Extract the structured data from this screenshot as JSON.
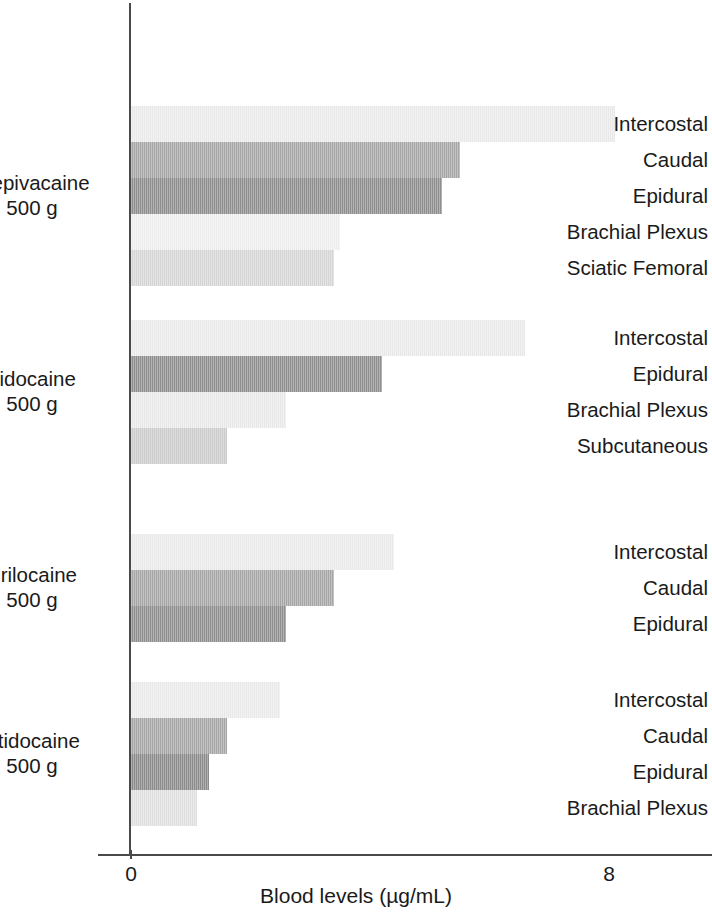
{
  "chart_data": {
    "type": "bar",
    "orientation": "horizontal",
    "title": "",
    "xlabel": "Blood levels (µg/mL)",
    "ylabel": "",
    "xlim": [
      0,
      8.6
    ],
    "xticks": [
      0,
      8
    ],
    "xticklabels": [
      "0",
      "8"
    ],
    "grid": false,
    "legend": "none",
    "groups": [
      {
        "name": "Mepivacaine",
        "dose": "500 g",
        "label": "Mepivacaine\n500 g",
        "bars": [
          {
            "label": "Intercostal",
            "value": 8.1,
            "color": "#ededed"
          },
          {
            "label": "Caudal",
            "value": 5.5,
            "color": "#a9a9a9"
          },
          {
            "label": "Epidural",
            "value": 5.2,
            "color": "#919191"
          },
          {
            "label": "Brachial Plexus",
            "value": 3.5,
            "color": "#f1f1f1"
          },
          {
            "label": "Sciatic Femoral",
            "value": 3.4,
            "color": "#d9d9d9"
          }
        ]
      },
      {
        "name": "Lidocaine",
        "dose": "500 g",
        "label": "Lidocaine\n500 g",
        "bars": [
          {
            "label": "Intercostal",
            "value": 6.6,
            "color": "#ededed"
          },
          {
            "label": "Epidural",
            "value": 4.2,
            "color": "#919191"
          },
          {
            "label": "Brachial Plexus",
            "value": 2.6,
            "color": "#ececec"
          },
          {
            "label": "Subcutaneous",
            "value": 1.6,
            "color": "#cfcfcf"
          }
        ]
      },
      {
        "name": "Prilocaine",
        "dose": "500 g",
        "label": "Prilocaine\n500 g",
        "bars": [
          {
            "label": "Intercostal",
            "value": 4.4,
            "color": "#ededed"
          },
          {
            "label": "Caudal",
            "value": 3.4,
            "color": "#a9a9a9"
          },
          {
            "label": "Epidural",
            "value": 2.6,
            "color": "#919191"
          }
        ]
      },
      {
        "name": "Etidocaine",
        "dose": "500 g",
        "label": "Etidocaine\n500 g",
        "bars": [
          {
            "label": "Intercostal",
            "value": 2.5,
            "color": "#ededed"
          },
          {
            "label": "Caudal",
            "value": 1.6,
            "color": "#a9a9a9"
          },
          {
            "label": "Epidural",
            "value": 1.3,
            "color": "#8e8e8e"
          },
          {
            "label": "Brachial Plexus",
            "value": 1.1,
            "color": "#e2e2e2"
          }
        ]
      }
    ]
  },
  "axis": {
    "x_title": "Blood levels (µg/mL)",
    "tick_zero": "0",
    "tick_eight": "8"
  }
}
